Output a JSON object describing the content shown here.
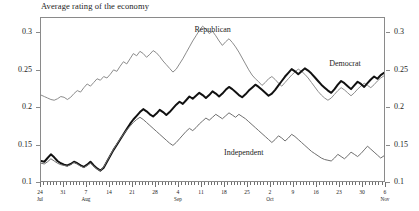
{
  "chart_data": {
    "type": "line",
    "title": "Average rating of the economy",
    "xlabel": "",
    "ylabel": "",
    "ylim": [
      0.1,
      0.32
    ],
    "yticks": [
      0.1,
      0.15,
      0.2,
      0.25,
      0.3
    ],
    "ytick_labels": [
      "0.1",
      "0.15",
      "0.2",
      "0.25",
      "0.3"
    ],
    "right_axis": true,
    "right_ytick_labels": [
      "0.1",
      "0.15",
      "0.2",
      "0.25",
      "0.3"
    ],
    "grid": false,
    "legend_position": "inline-annotations",
    "xlim_days": [
      0,
      105
    ],
    "xticks_major": [
      {
        "day": 0,
        "date": "24",
        "month": "Jul"
      },
      {
        "day": 7,
        "date": "31",
        "month": ""
      },
      {
        "day": 14,
        "date": "7",
        "month": "Aug"
      },
      {
        "day": 21,
        "date": "14",
        "month": ""
      },
      {
        "day": 28,
        "date": "21",
        "month": ""
      },
      {
        "day": 35,
        "date": "28",
        "month": ""
      },
      {
        "day": 42,
        "date": "4",
        "month": "Sep"
      },
      {
        "day": 49,
        "date": "11",
        "month": ""
      },
      {
        "day": 56,
        "date": "18",
        "month": ""
      },
      {
        "day": 63,
        "date": "25",
        "month": ""
      },
      {
        "day": 70,
        "date": "2",
        "month": "Oct"
      },
      {
        "day": 77,
        "date": "9",
        "month": ""
      },
      {
        "day": 84,
        "date": "16",
        "month": ""
      },
      {
        "day": 91,
        "date": "23",
        "month": ""
      },
      {
        "day": 98,
        "date": "30",
        "month": ""
      },
      {
        "day": 105,
        "date": "6",
        "month": "Nov"
      }
    ],
    "series": [
      {
        "name": "Republican",
        "color": "#8c8c8c",
        "width": 1,
        "label_x_day": 47,
        "label_y_value": 0.303,
        "values": [
          0.216,
          0.214,
          0.212,
          0.21,
          0.209,
          0.211,
          0.214,
          0.213,
          0.21,
          0.213,
          0.218,
          0.222,
          0.22,
          0.226,
          0.231,
          0.228,
          0.233,
          0.238,
          0.236,
          0.241,
          0.239,
          0.244,
          0.25,
          0.248,
          0.255,
          0.261,
          0.258,
          0.265,
          0.272,
          0.269,
          0.275,
          0.272,
          0.267,
          0.271,
          0.276,
          0.273,
          0.268,
          0.262,
          0.257,
          0.252,
          0.247,
          0.251,
          0.258,
          0.265,
          0.273,
          0.281,
          0.289,
          0.296,
          0.303,
          0.309,
          0.305,
          0.299,
          0.302,
          0.296,
          0.289,
          0.283,
          0.288,
          0.292,
          0.287,
          0.281,
          0.274,
          0.266,
          0.258,
          0.25,
          0.243,
          0.238,
          0.234,
          0.229,
          0.233,
          0.238,
          0.241,
          0.237,
          0.232,
          0.228,
          0.233,
          0.238,
          0.243,
          0.247,
          0.251,
          0.248,
          0.244,
          0.239,
          0.233,
          0.227,
          0.221,
          0.216,
          0.212,
          0.209,
          0.212,
          0.217,
          0.222,
          0.226,
          0.223,
          0.219,
          0.215,
          0.219,
          0.224,
          0.228,
          0.232,
          0.229,
          0.226,
          0.23,
          0.235,
          0.239,
          0.242
        ]
      },
      {
        "name": "Democrat",
        "color": "#111111",
        "width": 2,
        "label_x_day": 88,
        "label_y_value": 0.258,
        "values": [
          0.127,
          0.126,
          0.131,
          0.136,
          0.132,
          0.127,
          0.124,
          0.122,
          0.121,
          0.123,
          0.126,
          0.124,
          0.121,
          0.119,
          0.122,
          0.126,
          0.121,
          0.117,
          0.114,
          0.118,
          0.126,
          0.134,
          0.142,
          0.149,
          0.156,
          0.163,
          0.17,
          0.177,
          0.183,
          0.188,
          0.193,
          0.197,
          0.194,
          0.19,
          0.187,
          0.191,
          0.196,
          0.193,
          0.189,
          0.193,
          0.198,
          0.203,
          0.207,
          0.204,
          0.209,
          0.214,
          0.211,
          0.215,
          0.219,
          0.216,
          0.212,
          0.216,
          0.221,
          0.218,
          0.214,
          0.218,
          0.223,
          0.227,
          0.224,
          0.22,
          0.216,
          0.213,
          0.217,
          0.222,
          0.226,
          0.23,
          0.227,
          0.223,
          0.219,
          0.215,
          0.218,
          0.223,
          0.229,
          0.235,
          0.241,
          0.246,
          0.251,
          0.248,
          0.244,
          0.248,
          0.252,
          0.249,
          0.245,
          0.24,
          0.235,
          0.23,
          0.226,
          0.222,
          0.219,
          0.224,
          0.23,
          0.235,
          0.232,
          0.228,
          0.224,
          0.229,
          0.234,
          0.231,
          0.227,
          0.232,
          0.237,
          0.241,
          0.238,
          0.243,
          0.246
        ]
      },
      {
        "name": "Independent",
        "color": "#6f6f6f",
        "width": 1,
        "label_x_day": 56,
        "label_y_value": 0.139,
        "values": [
          0.124,
          0.123,
          0.126,
          0.13,
          0.127,
          0.124,
          0.122,
          0.121,
          0.12,
          0.122,
          0.125,
          0.123,
          0.12,
          0.118,
          0.121,
          0.124,
          0.12,
          0.116,
          0.114,
          0.119,
          0.127,
          0.135,
          0.143,
          0.15,
          0.157,
          0.163,
          0.169,
          0.174,
          0.179,
          0.183,
          0.186,
          0.183,
          0.179,
          0.175,
          0.171,
          0.167,
          0.163,
          0.159,
          0.155,
          0.151,
          0.148,
          0.152,
          0.157,
          0.162,
          0.167,
          0.171,
          0.168,
          0.172,
          0.177,
          0.181,
          0.185,
          0.182,
          0.186,
          0.19,
          0.187,
          0.184,
          0.188,
          0.192,
          0.189,
          0.186,
          0.19,
          0.187,
          0.184,
          0.18,
          0.176,
          0.172,
          0.168,
          0.164,
          0.16,
          0.156,
          0.152,
          0.156,
          0.161,
          0.158,
          0.154,
          0.158,
          0.163,
          0.16,
          0.156,
          0.152,
          0.148,
          0.144,
          0.14,
          0.137,
          0.134,
          0.131,
          0.129,
          0.128,
          0.127,
          0.131,
          0.136,
          0.133,
          0.13,
          0.134,
          0.139,
          0.136,
          0.133,
          0.137,
          0.142,
          0.147,
          0.143,
          0.139,
          0.135,
          0.131,
          0.134
        ]
      }
    ]
  }
}
